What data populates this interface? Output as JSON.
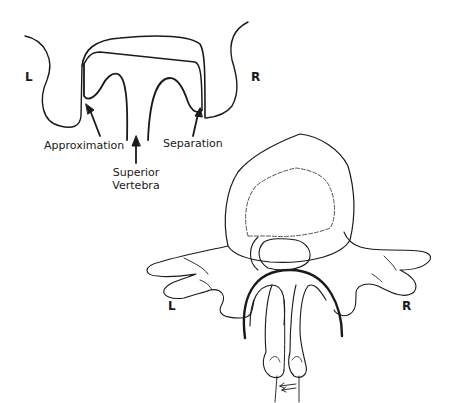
{
  "figure": {
    "top_diagram": {
      "left_label": "L",
      "right_label": "R",
      "annotations": {
        "approximation": "Approximation",
        "superior_vertebra_line1": "Superior",
        "superior_vertebra_line2": "Vertebra",
        "separation": "Separation"
      }
    },
    "bottom_diagram": {
      "left_label": "L",
      "right_label": "R"
    },
    "colors": {
      "line": "#1a1a1a",
      "background": "#ffffff",
      "dashed": "#555555"
    }
  }
}
